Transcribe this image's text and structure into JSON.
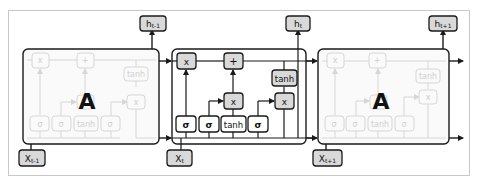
{
  "diagram": {
    "colors": {
      "line": "#1a1a1a",
      "node_fill_gray": "#d9d9d9",
      "node_fill_white": "#ffffff",
      "faded": "#d6d6d6",
      "frame": "#c8c8c8",
      "cell_fill": "#ffffff",
      "faded_cell_fill": "#fafafa"
    },
    "cells": [
      {
        "id": "cell-prev",
        "label": "A",
        "faded": true
      },
      {
        "id": "cell-current",
        "label": "",
        "faded": false
      },
      {
        "id": "cell-next",
        "label": "A",
        "faded": true
      }
    ],
    "inputs": [
      {
        "id": "x-prev",
        "label": "Xt-1",
        "base": "X",
        "sub": "t-1"
      },
      {
        "id": "x-current",
        "label": "Xt",
        "base": "X",
        "sub": "t"
      },
      {
        "id": "x-next",
        "label": "Xt+1",
        "base": "X",
        "sub": "t+1"
      }
    ],
    "outputs": [
      {
        "id": "h-prev",
        "label": "ht-1",
        "base": "h",
        "sub": "t-1"
      },
      {
        "id": "h-current",
        "label": "ht",
        "base": "h",
        "sub": "t"
      },
      {
        "id": "h-next",
        "label": "ht+1",
        "base": "h",
        "sub": "t+1"
      }
    ],
    "gates": {
      "sigma1": "σ",
      "sigma2": "σ",
      "tanh1": "tanh",
      "sigma3": "σ"
    },
    "ops": {
      "mul_forget": "x",
      "add_cell": "+",
      "mul_input": "x",
      "tanh_out": "tanh",
      "mul_output": "x"
    },
    "faded_labels": {
      "sigma": "σ",
      "tanh": "tanh",
      "mul": "x",
      "add": "+"
    }
  }
}
